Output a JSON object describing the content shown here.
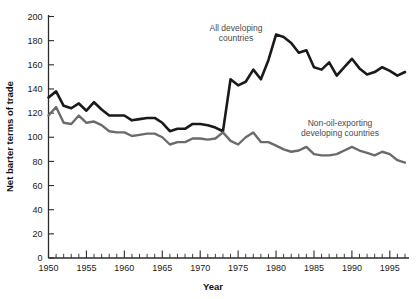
{
  "chart_data": {
    "type": "line",
    "title": "",
    "xlabel": "Year",
    "ylabel": "Net barter terms of trade",
    "xlim": [
      1950,
      1997
    ],
    "ylim": [
      0,
      200
    ],
    "yticks": [
      0,
      20,
      40,
      60,
      80,
      100,
      120,
      140,
      160,
      180,
      200
    ],
    "xticks": [
      1950,
      1955,
      1960,
      1965,
      1970,
      1975,
      1980,
      1985,
      1990,
      1995
    ],
    "xtick_minor_step": 1,
    "grid": false,
    "legend": "inline-annotation",
    "x": [
      1950,
      1951,
      1952,
      1953,
      1954,
      1955,
      1956,
      1957,
      1958,
      1959,
      1960,
      1961,
      1962,
      1963,
      1964,
      1965,
      1966,
      1967,
      1968,
      1969,
      1970,
      1971,
      1972,
      1973,
      1974,
      1975,
      1976,
      1977,
      1978,
      1979,
      1980,
      1981,
      1982,
      1983,
      1984,
      1985,
      1986,
      1987,
      1988,
      1989,
      1990,
      1991,
      1992,
      1993,
      1994,
      1995,
      1996,
      1997
    ],
    "series": [
      {
        "name": "All developing countries",
        "color": "#1a1a1a",
        "linewidth": 2.6,
        "label_text_line1": "All developing",
        "label_text_line2": "countries",
        "values": [
          133,
          138,
          126,
          124,
          128,
          122,
          129,
          123,
          118,
          118,
          118,
          114,
          115,
          116,
          116,
          112,
          105,
          107,
          107,
          111,
          111,
          110,
          108,
          105,
          148,
          143,
          146,
          156,
          148,
          164,
          185,
          183,
          178,
          170,
          172,
          158,
          156,
          162,
          151,
          158,
          165,
          157,
          152,
          154,
          158,
          155,
          151,
          154
        ]
      },
      {
        "name": "Non-oil-exporting developing countries",
        "color": "#6b6b6b",
        "linewidth": 2.4,
        "label_text_line1": "Non-oil-exporting",
        "label_text_line2": "developing countries",
        "values": [
          118,
          125,
          112,
          111,
          118,
          112,
          113,
          110,
          105,
          104,
          104,
          101,
          102,
          103,
          103,
          100,
          94,
          96,
          96,
          99,
          99,
          98,
          99,
          104,
          97,
          94,
          100,
          104,
          96,
          96,
          93,
          90,
          88,
          89,
          92,
          86,
          85,
          85,
          86,
          89,
          92,
          89,
          87,
          85,
          88,
          86,
          81,
          79
        ]
      }
    ]
  },
  "axis_titles": {
    "x": "Year",
    "y": "Net barter terms of trade"
  },
  "y_tick_labels": [
    "0",
    "20",
    "40",
    "60",
    "80",
    "100",
    "120",
    "140",
    "160",
    "180",
    "200"
  ],
  "x_tick_labels": [
    "1950",
    "1955",
    "1960",
    "1965",
    "1970",
    "1975",
    "1980",
    "1985",
    "1990",
    "1995"
  ],
  "annotations": [
    {
      "name": "all-developing-countries-label",
      "line1": "All developing",
      "line2": "countries"
    },
    {
      "name": "non-oil-exporting-label",
      "line1": "Non-oil-exporting",
      "line2": "developing countries"
    }
  ],
  "colors": {
    "series_all_developing": "#1a1a1a",
    "series_non_oil": "#6b6b6b",
    "axis": "#2b2b2b",
    "background": "#ffffff",
    "annotation_text": "#4a4a4a"
  }
}
